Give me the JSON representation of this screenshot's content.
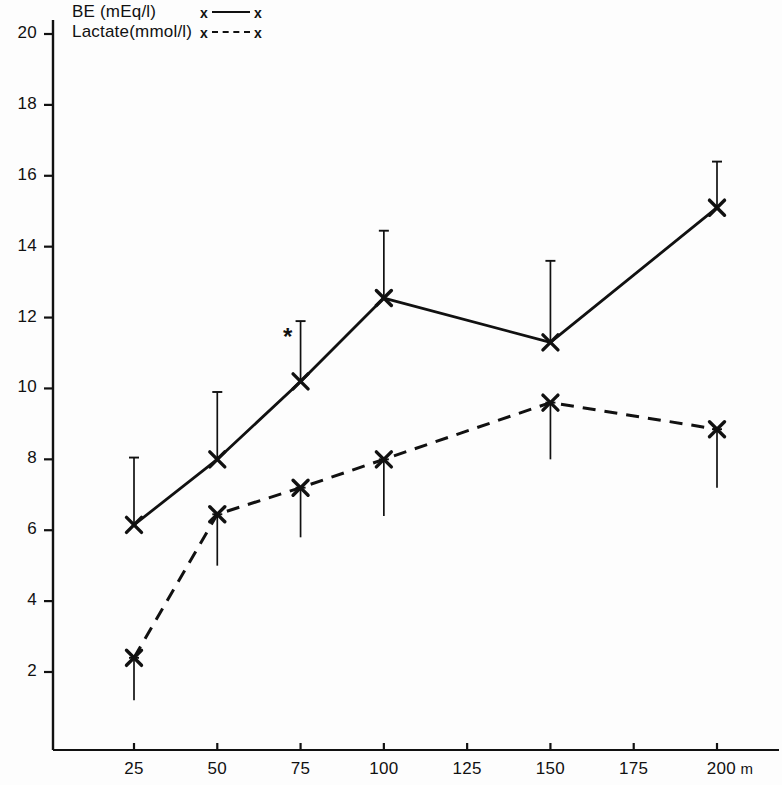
{
  "chart_data": {
    "type": "line",
    "title": "",
    "xlabel": "m",
    "ylabel": "",
    "x": [
      25,
      50,
      75,
      100,
      150,
      200
    ],
    "xlim": [
      0,
      215
    ],
    "ylim": [
      0,
      20.6
    ],
    "grid": false,
    "legend_position": "top-left",
    "xtick_labels": [
      "25",
      "50",
      "75",
      "100",
      "125",
      "150",
      "175",
      "200"
    ],
    "xtick_values": [
      25,
      50,
      75,
      100,
      125,
      150,
      175,
      200
    ],
    "xtick_unit": "m",
    "ytick_labels": [
      "2",
      "4",
      "6",
      "8",
      "10",
      "12",
      "14",
      "16",
      "18",
      "20"
    ],
    "ytick_values": [
      2,
      4,
      6,
      8,
      10,
      12,
      14,
      16,
      18,
      20
    ],
    "annotations": [
      {
        "name": "significance-asterisk",
        "x": 75,
        "y": 11.3,
        "text": "*"
      }
    ],
    "series": [
      {
        "name": "BE (mEq/l)",
        "style": "solid",
        "marker": "x",
        "x": [
          25,
          50,
          75,
          100,
          150,
          200
        ],
        "values": [
          6.15,
          8.0,
          10.2,
          12.55,
          11.3,
          15.1
        ],
        "error_upper": [
          8.05,
          9.9,
          11.9,
          14.45,
          13.6,
          16.4
        ],
        "error_lower": [
          6.15,
          8.0,
          10.2,
          12.55,
          11.3,
          15.1
        ]
      },
      {
        "name": "Lactate(mmol/l)",
        "style": "dashed",
        "marker": "x",
        "x": [
          25,
          50,
          75,
          100,
          150,
          200
        ],
        "values": [
          2.4,
          6.45,
          7.2,
          8.0,
          9.6,
          8.85
        ],
        "error_upper": [
          2.4,
          6.45,
          7.2,
          8.0,
          9.6,
          8.85
        ],
        "error_lower": [
          1.2,
          5.0,
          5.8,
          6.4,
          8.0,
          7.2
        ]
      }
    ]
  },
  "legend": {
    "entries": [
      {
        "label": "BE (mEq/l)",
        "sample_left": "x",
        "sample_right": "x",
        "style": "solid"
      },
      {
        "label": "Lactate(mmol/l)",
        "sample_left": "x",
        "sample_right": "x",
        "style": "dashed"
      }
    ]
  },
  "colors": {
    "line": "#111111",
    "axis": "#111111",
    "background": "#fdfdfd"
  }
}
